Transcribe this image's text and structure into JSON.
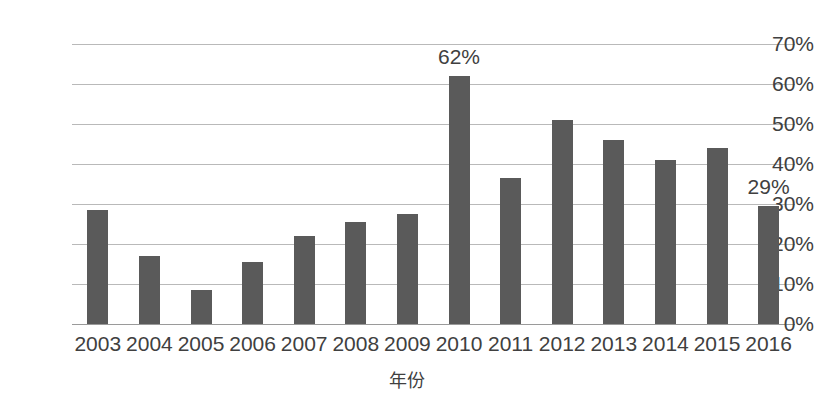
{
  "chart_data": {
    "type": "bar",
    "title": "",
    "xlabel": "年份",
    "ylabel": "",
    "categories": [
      "2003",
      "2004",
      "2005",
      "2006",
      "2007",
      "2008",
      "2009",
      "2010",
      "2011",
      "2012",
      "2013",
      "2014",
      "2015",
      "2016"
    ],
    "values": [
      28.5,
      17.0,
      8.5,
      15.5,
      22.0,
      25.5,
      27.5,
      62.0,
      36.5,
      51.0,
      46.0,
      41.0,
      44.0,
      29.5
    ],
    "ylim": [
      0,
      70
    ],
    "ytick_labels": [
      "70%",
      "60%",
      "50%",
      "40%",
      "30%",
      "20%",
      "10%",
      "0%"
    ],
    "ytick_values": [
      70,
      60,
      50,
      40,
      30,
      20,
      10,
      0
    ],
    "grid": true,
    "legend": "none",
    "bar_color": "#5a5a5a",
    "grid_color": "#b9b9b9",
    "annotations": [
      {
        "category": "2010",
        "text": "62%"
      },
      {
        "category": "2016",
        "text": "29%"
      }
    ]
  }
}
